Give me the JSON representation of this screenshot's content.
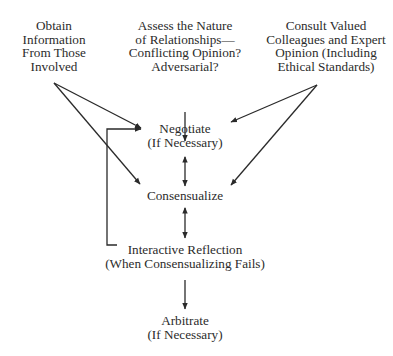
{
  "diagram": {
    "type": "flowchart",
    "nodes": {
      "obtain": {
        "lines": [
          "Obtain",
          "Information",
          "From Those",
          "Involved"
        ]
      },
      "assess": {
        "lines": [
          "Assess the Nature",
          "of Relationships—",
          "Conflicting Opinion?",
          "Adversarial?"
        ]
      },
      "consult": {
        "lines": [
          "Consult Valued",
          "Colleagues and Expert",
          "Opinion (Including",
          "Ethical Standards)"
        ]
      },
      "negotiate": {
        "lines": [
          "Negotiate",
          "(If Necessary)"
        ]
      },
      "consensualize": {
        "lines": [
          "Consensualize"
        ]
      },
      "reflection": {
        "lines": [
          "Interactive Reflection",
          "(When Consensualizing Fails)"
        ]
      },
      "arbitrate": {
        "lines": [
          "Arbitrate",
          "(If Necessary)"
        ]
      }
    },
    "edges": [
      {
        "from": "obtain",
        "to": "negotiate",
        "style": "arrow"
      },
      {
        "from": "obtain",
        "to": "consensualize",
        "style": "arrow"
      },
      {
        "from": "assess",
        "to": "negotiate",
        "style": "arrow"
      },
      {
        "from": "consult",
        "to": "negotiate",
        "style": "arrow"
      },
      {
        "from": "consult",
        "to": "consensualize",
        "style": "arrow"
      },
      {
        "from": "negotiate",
        "to": "consensualize",
        "style": "double-arrow"
      },
      {
        "from": "consensualize",
        "to": "reflection",
        "style": "double-arrow"
      },
      {
        "from": "reflection",
        "to": "negotiate",
        "style": "feedback-loop-arrow"
      },
      {
        "from": "reflection",
        "to": "arbitrate",
        "style": "arrow"
      }
    ],
    "colors": {
      "line": "#2a2a2a",
      "text": "#2b2b2b",
      "background": "#ffffff"
    }
  }
}
